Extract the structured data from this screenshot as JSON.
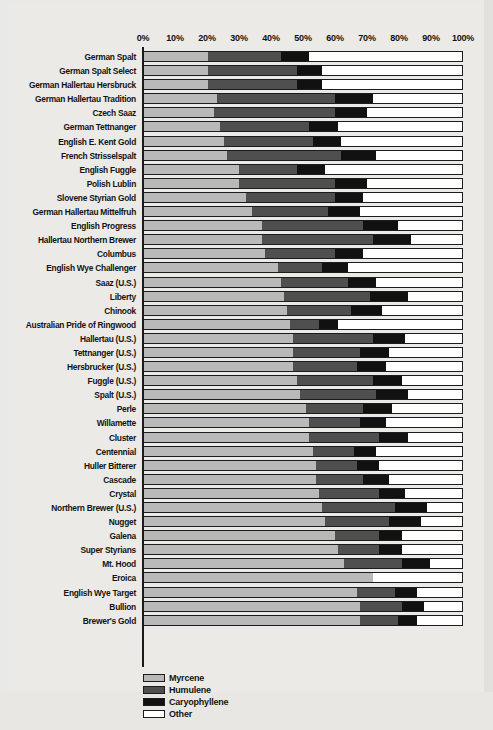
{
  "chart_data": {
    "type": "bar",
    "orientation": "horizontal",
    "stacked": true,
    "title": "",
    "subtitle": "",
    "xlabel": "",
    "ylabel": "",
    "xlim": [
      0,
      100
    ],
    "xunit": "%",
    "grid": false,
    "legend_position": "bottom-left",
    "tick_labels": [
      "0%",
      "10%",
      "20%",
      "30%",
      "40%",
      "50%",
      "60%",
      "70%",
      "80%",
      "90%",
      "100%"
    ],
    "tick_values": [
      0,
      10,
      20,
      30,
      40,
      50,
      60,
      70,
      80,
      90,
      100
    ],
    "series": [
      {
        "name": "Myrcene",
        "color": "#b9b9b9"
      },
      {
        "name": "Humulene",
        "color": "#4f4f4f"
      },
      {
        "name": "Caryophyllene",
        "color": "#111111"
      },
      {
        "name": "Other",
        "color": "#ffffff"
      }
    ],
    "categories": [
      "German Spalt",
      "German Spalt Select",
      "German Hallertau Hersbruck",
      "German Hallertau Tradition",
      "Czech Saaz",
      "German Tettnanger",
      "English E. Kent Gold",
      "French Strisselspalt",
      "English Fuggle",
      "Polish Lublin",
      "Slovene Styrian Gold",
      "German Hallertau Mittelfruh",
      "English Progress",
      "Hallertau Northern Brewer",
      "Columbus",
      "English Wye Challenger",
      "Saaz (U.S.)",
      "Liberty",
      "Chinook",
      "Australian Pride of Ringwood",
      "Hallertau (U.S.)",
      "Tettnanger (U.S.)",
      "Hersbrucker (U.S.)",
      "Fuggle (U.S.)",
      "Spalt (U.S.)",
      "Perle",
      "Willamette",
      "Cluster",
      "Centennial",
      "Huller Bitterer",
      "Cascade",
      "Crystal",
      "Northern Brewer (U.S.)",
      "Nugget",
      "Galena",
      "Super Styrians",
      "Mt. Hood",
      "Eroica",
      "English Wye Target",
      "Bullion",
      "Brewer's Gold"
    ],
    "rows": [
      {
        "category": "German Spalt",
        "Myrcene": 20,
        "Humulene": 23,
        "Caryophyllene": 9,
        "Other": 48
      },
      {
        "category": "German Spalt Select",
        "Myrcene": 20,
        "Humulene": 28,
        "Caryophyllene": 8,
        "Other": 44
      },
      {
        "category": "German Hallertau Hersbruck",
        "Myrcene": 20,
        "Humulene": 28,
        "Caryophyllene": 8,
        "Other": 44
      },
      {
        "category": "German Hallertau Tradition",
        "Myrcene": 23,
        "Humulene": 37,
        "Caryophyllene": 12,
        "Other": 28
      },
      {
        "category": "Czech Saaz",
        "Myrcene": 22,
        "Humulene": 38,
        "Caryophyllene": 10,
        "Other": 30
      },
      {
        "category": "German Tettnanger",
        "Myrcene": 24,
        "Humulene": 28,
        "Caryophyllene": 9,
        "Other": 39
      },
      {
        "category": "English E. Kent Gold",
        "Myrcene": 25,
        "Humulene": 28,
        "Caryophyllene": 9,
        "Other": 38
      },
      {
        "category": "French Strisselspalt",
        "Myrcene": 26,
        "Humulene": 36,
        "Caryophyllene": 11,
        "Other": 27
      },
      {
        "category": "English Fuggle",
        "Myrcene": 30,
        "Humulene": 18,
        "Caryophyllene": 9,
        "Other": 43
      },
      {
        "category": "Polish Lublin",
        "Myrcene": 30,
        "Humulene": 30,
        "Caryophyllene": 10,
        "Other": 30
      },
      {
        "category": "Slovene Styrian Gold",
        "Myrcene": 32,
        "Humulene": 28,
        "Caryophyllene": 9,
        "Other": 31
      },
      {
        "category": "German Hallertau Mittelfruh",
        "Myrcene": 34,
        "Humulene": 24,
        "Caryophyllene": 10,
        "Other": 32
      },
      {
        "category": "English Progress",
        "Myrcene": 37,
        "Humulene": 32,
        "Caryophyllene": 11,
        "Other": 20
      },
      {
        "category": "Hallertau Northern Brewer",
        "Myrcene": 37,
        "Humulene": 35,
        "Caryophyllene": 12,
        "Other": 16
      },
      {
        "category": "Columbus",
        "Myrcene": 38,
        "Humulene": 22,
        "Caryophyllene": 9,
        "Other": 31
      },
      {
        "category": "English Wye Challenger",
        "Myrcene": 42,
        "Humulene": 14,
        "Caryophyllene": 8,
        "Other": 36
      },
      {
        "category": "Saaz (U.S.)",
        "Myrcene": 43,
        "Humulene": 21,
        "Caryophyllene": 9,
        "Other": 27
      },
      {
        "category": "Liberty",
        "Myrcene": 44,
        "Humulene": 27,
        "Caryophyllene": 12,
        "Other": 17
      },
      {
        "category": "Chinook",
        "Myrcene": 45,
        "Humulene": 20,
        "Caryophyllene": 10,
        "Other": 25
      },
      {
        "category": "Australian Pride of Ringwood",
        "Myrcene": 46,
        "Humulene": 9,
        "Caryophyllene": 6,
        "Other": 39
      },
      {
        "category": "Hallertau (U.S.)",
        "Myrcene": 47,
        "Humulene": 25,
        "Caryophyllene": 10,
        "Other": 18
      },
      {
        "category": "Tettnanger (U.S.)",
        "Myrcene": 47,
        "Humulene": 21,
        "Caryophyllene": 9,
        "Other": 23
      },
      {
        "category": "Hersbrucker (U.S.)",
        "Myrcene": 47,
        "Humulene": 20,
        "Caryophyllene": 9,
        "Other": 24
      },
      {
        "category": "Fuggle (U.S.)",
        "Myrcene": 48,
        "Humulene": 24,
        "Caryophyllene": 9,
        "Other": 19
      },
      {
        "category": "Spalt (U.S.)",
        "Myrcene": 49,
        "Humulene": 24,
        "Caryophyllene": 10,
        "Other": 17
      },
      {
        "category": "Perle",
        "Myrcene": 51,
        "Humulene": 18,
        "Caryophyllene": 9,
        "Other": 22
      },
      {
        "category": "Willamette",
        "Myrcene": 52,
        "Humulene": 16,
        "Caryophyllene": 8,
        "Other": 24
      },
      {
        "category": "Cluster",
        "Myrcene": 52,
        "Humulene": 22,
        "Caryophyllene": 9,
        "Other": 17
      },
      {
        "category": "Centennial",
        "Myrcene": 53,
        "Humulene": 13,
        "Caryophyllene": 7,
        "Other": 27
      },
      {
        "category": "Huller Bitterer",
        "Myrcene": 54,
        "Humulene": 13,
        "Caryophyllene": 7,
        "Other": 26
      },
      {
        "category": "Cascade",
        "Myrcene": 54,
        "Humulene": 15,
        "Caryophyllene": 8,
        "Other": 23
      },
      {
        "category": "Crystal",
        "Myrcene": 55,
        "Humulene": 19,
        "Caryophyllene": 8,
        "Other": 18
      },
      {
        "category": "Northern Brewer (U.S.)",
        "Myrcene": 56,
        "Humulene": 23,
        "Caryophyllene": 10,
        "Other": 11
      },
      {
        "category": "Nugget",
        "Myrcene": 57,
        "Humulene": 20,
        "Caryophyllene": 10,
        "Other": 13
      },
      {
        "category": "Galena",
        "Myrcene": 60,
        "Humulene": 14,
        "Caryophyllene": 7,
        "Other": 19
      },
      {
        "category": "Super Styrians",
        "Myrcene": 61,
        "Humulene": 13,
        "Caryophyllene": 7,
        "Other": 19
      },
      {
        "category": "Mt. Hood",
        "Myrcene": 63,
        "Humulene": 18,
        "Caryophyllene": 9,
        "Other": 10
      },
      {
        "category": "Eroica",
        "Myrcene": 72,
        "Humulene": 0,
        "Caryophyllene": 0,
        "Other": 28
      },
      {
        "category": "English Wye Target",
        "Myrcene": 67,
        "Humulene": 12,
        "Caryophyllene": 7,
        "Other": 14
      },
      {
        "category": "Bullion",
        "Myrcene": 68,
        "Humulene": 13,
        "Caryophyllene": 7,
        "Other": 12
      },
      {
        "category": "Brewer's Gold",
        "Myrcene": 68,
        "Humulene": 12,
        "Caryophyllene": 6,
        "Other": 14
      }
    ]
  },
  "legend": {
    "items": [
      {
        "label": "Myrcene",
        "key": "Myrcene"
      },
      {
        "label": "Humulene",
        "key": "Humulene"
      },
      {
        "label": "Caryophyllene",
        "key": "Caryophyllene"
      },
      {
        "label": "Other",
        "key": "Other"
      }
    ]
  }
}
